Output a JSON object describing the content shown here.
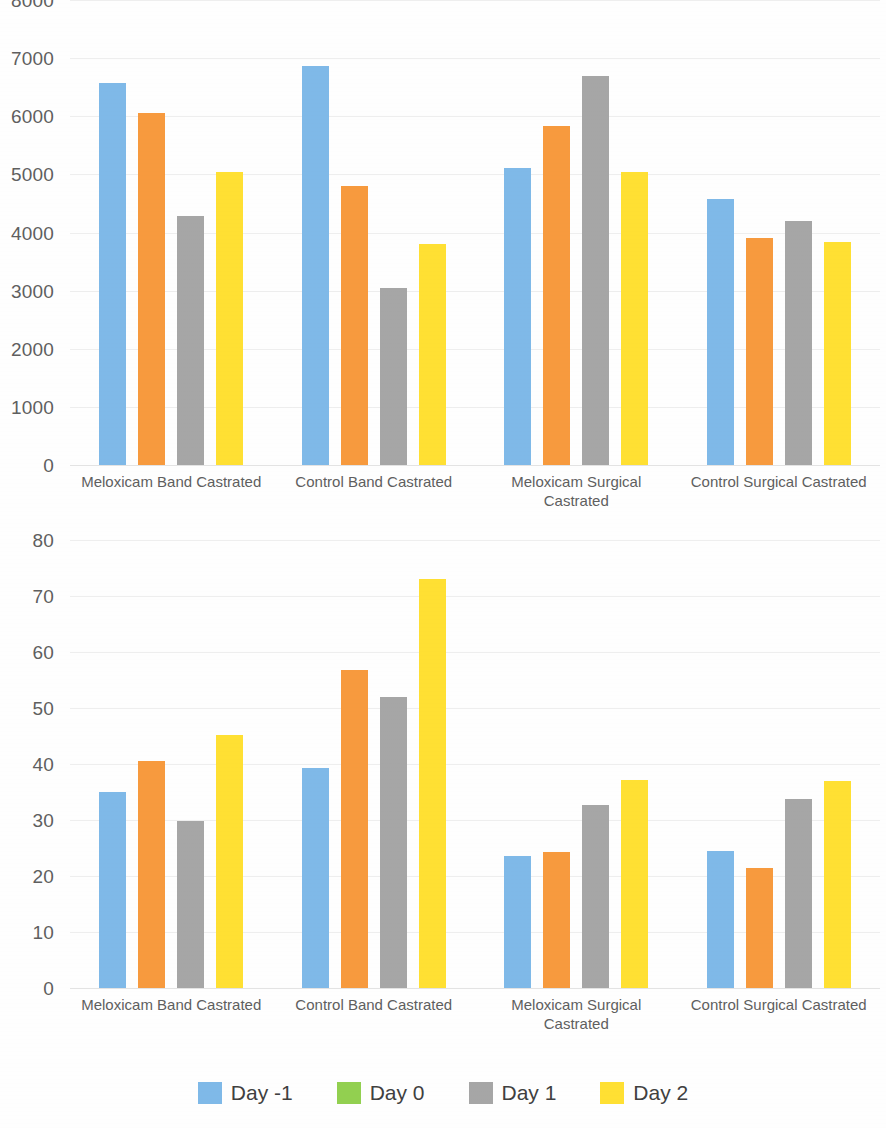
{
  "figure": {
    "background_color": "#fefefe",
    "axis_text_color": "#5f5f5f"
  },
  "series_colors": {
    "day_minus_1": "#7FB9E8",
    "day_0": "#92D050",
    "day_1": "#A6A6A6",
    "day_2": "#FFE033",
    "bar_second_series": "#F79A3E"
  },
  "legend": {
    "items": [
      {
        "label": "Day -1",
        "color": "#7FB9E8",
        "icon": "legend-color-swatch"
      },
      {
        "label": "Day 0",
        "color": "#92D050",
        "icon": "legend-color-swatch"
      },
      {
        "label": "Day 1",
        "color": "#A6A6A6",
        "icon": "legend-color-swatch"
      },
      {
        "label": "Day 2",
        "color": "#FFE033",
        "icon": "legend-color-swatch"
      }
    ]
  },
  "chart_data": [
    {
      "id": "top",
      "type": "bar",
      "title": "",
      "subtitle": "",
      "xlabel": "",
      "ylabel": "",
      "ylim": [
        0,
        8000
      ],
      "ytick_step": 1000,
      "ytick_labels": [
        "8000",
        "7000",
        "6000",
        "5000",
        "4000",
        "3000",
        "2000",
        "1000",
        "0"
      ],
      "ytick_values": [
        8000,
        7000,
        6000,
        5000,
        4000,
        3000,
        2000,
        1000,
        0
      ],
      "grid": true,
      "grid_axis": "y",
      "legend_position": "bottom",
      "categories": [
        "Meloxicam Band Castrated",
        "Control Band Castrated",
        "Meloxicam Surgical Castrated",
        "Control Surgical Castrated"
      ],
      "series": [
        {
          "name": "Day -1",
          "color": "#7FB9E8",
          "values": [
            6570,
            6860,
            5110,
            4580
          ]
        },
        {
          "name": "Day 0",
          "color": "#F79A3E",
          "values": [
            6050,
            4800,
            5840,
            3910
          ]
        },
        {
          "name": "Day 1",
          "color": "#A6A6A6",
          "values": [
            4280,
            3040,
            6690,
            4200
          ]
        },
        {
          "name": "Day 2",
          "color": "#FFE033",
          "values": [
            5040,
            3800,
            5040,
            3830
          ]
        }
      ]
    },
    {
      "id": "bottom",
      "type": "bar",
      "title": "",
      "subtitle": "",
      "xlabel": "",
      "ylabel": "",
      "ylim": [
        0,
        80
      ],
      "ytick_step": 10,
      "ytick_labels": [
        "80",
        "70",
        "60",
        "50",
        "40",
        "30",
        "20",
        "10",
        "0"
      ],
      "ytick_values": [
        80,
        70,
        60,
        50,
        40,
        30,
        20,
        10,
        0
      ],
      "grid": true,
      "grid_axis": "y",
      "legend_position": "bottom",
      "categories": [
        "Meloxicam Band Castrated",
        "Control Band Castrated",
        "Meloxicam Surgical Castrated",
        "Control Surgical Castrated"
      ],
      "series": [
        {
          "name": "Day -1",
          "color": "#7FB9E8",
          "values": [
            35.0,
            39.2,
            23.5,
            24.5
          ]
        },
        {
          "name": "Day 0",
          "color": "#F79A3E",
          "values": [
            40.5,
            56.8,
            24.3,
            21.5
          ]
        },
        {
          "name": "Day 1",
          "color": "#A6A6A6",
          "values": [
            29.8,
            52.0,
            32.6,
            33.8
          ]
        },
        {
          "name": "Day 2",
          "color": "#FFE033",
          "values": [
            45.2,
            73.0,
            37.1,
            37.0
          ]
        }
      ]
    }
  ]
}
